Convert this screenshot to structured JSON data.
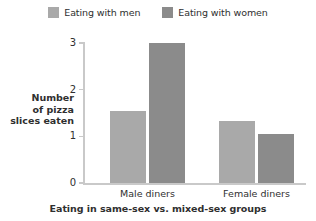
{
  "chart_data": {
    "type": "bar",
    "title": "",
    "xlabel": "Eating in same-sex vs. mixed-sex groups",
    "ylabel": "Number of pizza slices eaten",
    "ylabel_lines": [
      "Number",
      "of pizza",
      "slices eaten"
    ],
    "categories": [
      "Male diners",
      "Female diners"
    ],
    "series": [
      {
        "name": "Eating with men",
        "values": [
          1.55,
          1.33
        ],
        "color": "#a9a9a9"
      },
      {
        "name": "Eating with women",
        "values": [
          3.0,
          1.05
        ],
        "color": "#8b8b8b"
      }
    ],
    "ylim": [
      0,
      3
    ],
    "yticks": [
      0,
      1,
      2,
      3
    ],
    "ytick_labels": [
      "0",
      "1",
      "2",
      "3"
    ],
    "grid": false,
    "legend_position": "top",
    "axis_color": "#c9c9c9"
  }
}
